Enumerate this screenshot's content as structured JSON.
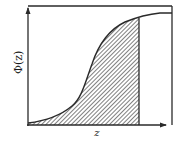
{
  "figure": {
    "type": "cumulative-distribution-diagram",
    "y_axis_label": "Φ(z)",
    "x_axis_label": "z",
    "colors": {
      "line": "#2a2a2a",
      "hatch": "#3a3a3a",
      "background": "#ffffff"
    },
    "curve": {
      "description": "S-shaped cumulative curve rising from bottom-left to plateau at top-right",
      "points": [
        [
          28,
          123
        ],
        [
          45,
          120
        ],
        [
          60,
          114
        ],
        [
          75,
          104
        ],
        [
          83,
          92
        ],
        [
          90,
          72
        ],
        [
          95,
          52
        ],
        [
          100,
          40
        ],
        [
          110,
          29
        ],
        [
          125,
          22
        ],
        [
          139,
          18
        ],
        [
          150,
          15
        ],
        [
          160,
          13
        ],
        [
          172,
          13
        ]
      ]
    },
    "shaded_region": {
      "description": "Area under the curve from left axis to vertical cutoff line, diagonal hatching",
      "cutoff_x_px": 139,
      "hatch_direction": "diagonal"
    }
  }
}
